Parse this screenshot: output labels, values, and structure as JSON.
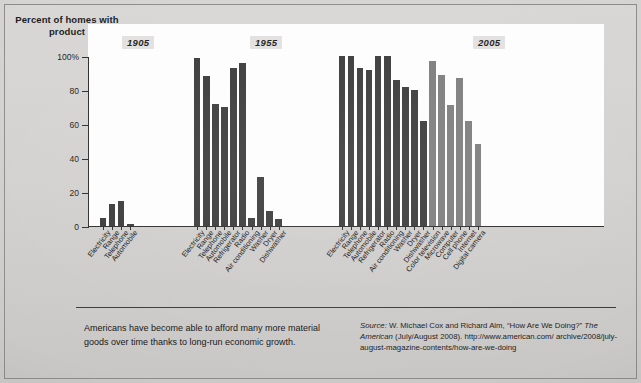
{
  "figure": {
    "y_axis_title": "Percent of homes with product",
    "caption": "Americans have become able to afford many more material goods over time thanks to long-run economic growth.",
    "source_label": "Source:",
    "source_line1": " W. Michael Cox and Richard Alm, “How Are We Doing?”",
    "source_italic": "The American",
    "source_line2": " (July/August 2008). http://www.american.com/",
    "source_line3": "archive/2008/july-august-magazine-contents/how-are-we-doing"
  },
  "chart_data": {
    "type": "bar",
    "title": "",
    "xlabel": "",
    "ylabel": "Percent of homes with product",
    "ylim": [
      0,
      100
    ],
    "yticks": [
      0,
      20,
      40,
      60,
      80,
      100
    ],
    "ytick_labels": [
      "0",
      "20",
      "40",
      "60",
      "80",
      "100%"
    ],
    "grid": false,
    "legend": "none",
    "group_labels": [
      "1905",
      "1955",
      "2005"
    ],
    "colors": {
      "dark_bar": "#3a3a3a",
      "light_bar": "#7d7d7d",
      "plot_background": "#fdfdfd",
      "page_background": "#d3d1cf"
    },
    "groups": [
      {
        "year": "1905",
        "categories": [
          "Electricity",
          "Range",
          "Telephone",
          "Automobile"
        ],
        "values": [
          5,
          13,
          15,
          1
        ],
        "shades": [
          "dark",
          "dark",
          "dark",
          "dark"
        ]
      },
      {
        "year": "1955",
        "categories": [
          "Electricity",
          "Range",
          "Telephone",
          "Automobile",
          "Refrigerator",
          "Radio",
          "Air conditioning",
          "Washer",
          "Dryer",
          "Dishwasher"
        ],
        "values": [
          99,
          88,
          72,
          70,
          93,
          96,
          5,
          29,
          9,
          4
        ],
        "shades": [
          "dark",
          "dark",
          "dark",
          "dark",
          "dark",
          "dark",
          "dark",
          "dark",
          "dark",
          "dark"
        ]
      },
      {
        "year": "2005",
        "categories": [
          "Electricity",
          "Range",
          "Telephone",
          "Automobile",
          "Refrigerator",
          "Radio",
          "Air conditioning",
          "Washer",
          "Dryer",
          "Dishwasher",
          "Color television",
          "Microwave",
          "Computer",
          "Cell phone",
          "Internet",
          "Digital camera"
        ],
        "values": [
          100,
          100,
          93,
          92,
          100,
          100,
          86,
          82,
          80,
          62,
          97,
          89,
          71,
          87,
          62,
          48
        ],
        "shades": [
          "dark",
          "dark",
          "dark",
          "dark",
          "dark",
          "dark",
          "dark",
          "dark",
          "dark",
          "dark",
          "light",
          "light",
          "light",
          "light",
          "light",
          "light"
        ]
      }
    ]
  }
}
